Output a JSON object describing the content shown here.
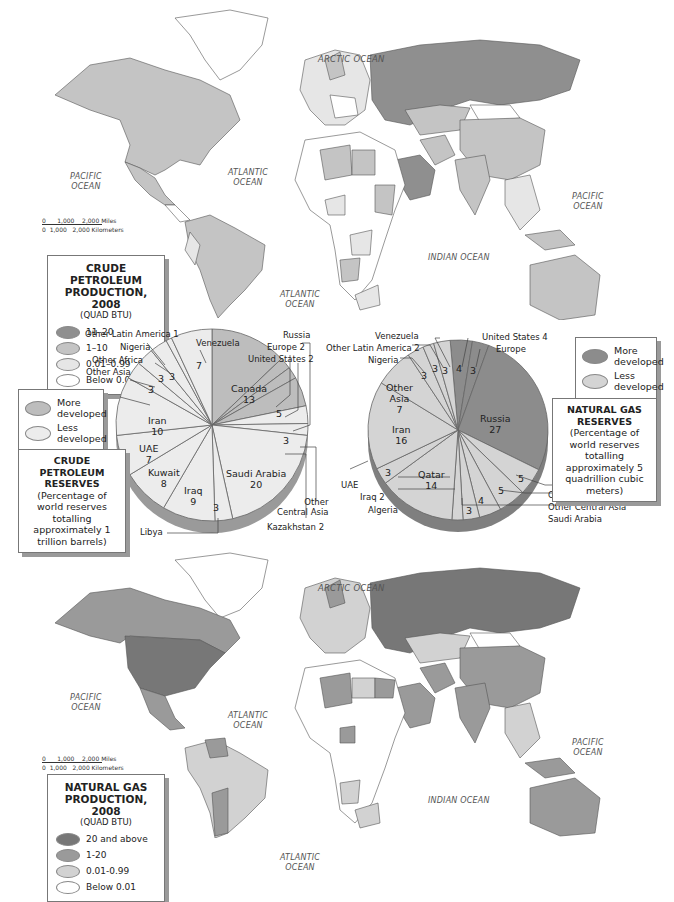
{
  "top_map": {
    "oceans": {
      "arctic": "ARCTIC OCEAN",
      "pacific_w": "PACIFIC\nOCEAN",
      "atlantic_n": "ATLANTIC\nOCEAN",
      "atlantic_s": "ATLANTIC\nOCEAN",
      "indian": "INDIAN OCEAN",
      "pacific_e": "PACIFIC\nOCEAN"
    },
    "scale": {
      "miles": "0      1,000    2,000 Miles",
      "km": "0  1,000   2,000 Kilometers"
    },
    "legend": {
      "title": "CRUDE PETROLEUM PRODUCTION, 2008",
      "subtitle": "(QUAD BTU)",
      "items": [
        {
          "label": "11–20",
          "color": "#8f8f8f"
        },
        {
          "label": "1–10",
          "color": "#c4c4c4"
        },
        {
          "label": "0.01–0.99",
          "color": "#e6e6e6"
        },
        {
          "label": "Below 0.01",
          "color": "#ffffff"
        }
      ]
    }
  },
  "crude_reserves": {
    "legend": {
      "more": "More developed",
      "less": "Less developed",
      "more_color": "#bdbdbd",
      "less_color": "#ececec"
    },
    "note": {
      "title": "CRUDE PETROLEUM RESERVES",
      "body": "(Percentage of world reserves totalling approximately 1 trillion barrels)"
    }
  },
  "gas_reserves": {
    "legend": {
      "more": "More developed",
      "less": "Less developed",
      "more_color": "#8c8c8c",
      "less_color": "#d4d4d4"
    },
    "note": {
      "title": "NATURAL GAS RESERVES",
      "body": "(Percentage of world reserves totalling approximately 5 quadrillion cubic meters)"
    }
  },
  "bottom_map": {
    "oceans": {
      "arctic": "ARCTIC OCEAN",
      "pacific_w": "PACIFIC\nOCEAN",
      "atlantic_n": "ATLANTIC\nOCEAN",
      "atlantic_s": "ATLANTIC\nOCEAN",
      "indian": "INDIAN OCEAN",
      "pacific_e": "PACIFIC\nOCEAN"
    },
    "scale": {
      "miles": "0      1,000    2,000 Miles",
      "km": "0  1,000   2,000 Kilometers"
    },
    "legend": {
      "title": "NATURAL GAS PRODUCTION, 2008",
      "subtitle": "(QUAD BTU)",
      "items": [
        {
          "label": "20 and above",
          "color": "#777777"
        },
        {
          "label": "1-20",
          "color": "#9a9a9a"
        },
        {
          "label": "0.01-0.99",
          "color": "#d2d2d2"
        },
        {
          "label": "Below 0.01",
          "color": "#ffffff"
        }
      ]
    }
  },
  "chart_data": [
    {
      "type": "pie",
      "title": "CRUDE PETROLEUM RESERVES",
      "subtitle": "Percentage of world reserves totalling approximately 1 trillion barrels",
      "legend": [
        "More developed",
        "Less developed"
      ],
      "slices": [
        {
          "label": "Canada",
          "value": 13,
          "group": "More developed"
        },
        {
          "label": "United States",
          "value": 2,
          "group": "More developed"
        },
        {
          "label": "Europe",
          "value": 2,
          "group": "More developed"
        },
        {
          "label": "Russia",
          "value": 5,
          "group": "More developed"
        },
        {
          "label": "Other Central Asia",
          "value": 3,
          "group": "Less developed"
        },
        {
          "label": "Kazakhstan",
          "value": 2,
          "group": "Less developed"
        },
        {
          "label": "Saudi Arabia",
          "value": 20,
          "group": "Less developed"
        },
        {
          "label": "Libya",
          "value": 3,
          "group": "Less developed"
        },
        {
          "label": "Iraq",
          "value": 9,
          "group": "Less developed"
        },
        {
          "label": "Kuwait",
          "value": 8,
          "group": "Less developed"
        },
        {
          "label": "UAE",
          "value": 7,
          "group": "Less developed"
        },
        {
          "label": "Iran",
          "value": 10,
          "group": "Less developed"
        },
        {
          "label": "Other Asia",
          "value": 3,
          "group": "Less developed"
        },
        {
          "label": "Other Africa",
          "value": 3,
          "group": "Less developed"
        },
        {
          "label": "Nigeria",
          "value": 3,
          "group": "Less developed"
        },
        {
          "label": "Other Latin America",
          "value": 1,
          "group": "Less developed"
        },
        {
          "label": "Venezuela",
          "value": 7,
          "group": "Less developed"
        }
      ]
    },
    {
      "type": "pie",
      "title": "NATURAL GAS RESERVES",
      "subtitle": "Percentage of world reserves totalling approximately 5 quadrillion cubic meters",
      "legend": [
        "More developed",
        "Less developed"
      ],
      "slices": [
        {
          "label": "United States",
          "value": 4,
          "group": "More developed"
        },
        {
          "label": "Europe",
          "value": 3,
          "group": "More developed"
        },
        {
          "label": "Russia",
          "value": 27,
          "group": "More developed"
        },
        {
          "label": "Other Southwest Asia",
          "value": 5,
          "group": "Less developed"
        },
        {
          "label": "Other Central Asia",
          "value": 5,
          "group": "Less developed"
        },
        {
          "label": "Saudi Arabia",
          "value": 4,
          "group": "Less developed"
        },
        {
          "label": "Algeria",
          "value": 3,
          "group": "Less developed"
        },
        {
          "label": "Iraq",
          "value": 2,
          "group": "Less developed"
        },
        {
          "label": "Qatar",
          "value": 14,
          "group": "Less developed"
        },
        {
          "label": "UAE",
          "value": 3,
          "group": "Less developed"
        },
        {
          "label": "Iran",
          "value": 16,
          "group": "Less developed"
        },
        {
          "label": "Other Asia",
          "value": 7,
          "group": "Less developed"
        },
        {
          "label": "Nigeria",
          "value": 3,
          "group": "Less developed"
        },
        {
          "label": "Other Latin America",
          "value": 2,
          "group": "Less developed"
        },
        {
          "label": "Venezuela",
          "value": 3,
          "group": "Less developed"
        }
      ]
    }
  ]
}
